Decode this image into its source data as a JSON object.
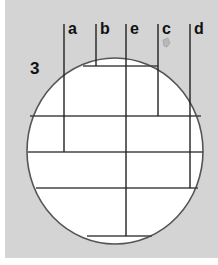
{
  "figure": {
    "figure_number": "3",
    "background_color": "#d4d4d4",
    "circle": {
      "cx": 115,
      "cy": 151,
      "rx": 88,
      "ry": 93,
      "fill": "#ffffff",
      "stroke": "#555555"
    },
    "chords": [
      {
        "name": "top-chord",
        "y": 66,
        "x1": 83,
        "x2": 158
      },
      {
        "name": "chord-1",
        "y": 116,
        "x1": 30,
        "x2": 201
      },
      {
        "name": "chord-2",
        "y": 152,
        "x1": 28,
        "x2": 203
      },
      {
        "name": "chord-3",
        "y": 188,
        "x1": 36,
        "x2": 198
      },
      {
        "name": "bottom-chord",
        "y": 236,
        "x1": 87,
        "x2": 152
      }
    ],
    "verticals": [
      {
        "label": "a",
        "x": 64,
        "y1": 24,
        "y2": 152
      },
      {
        "label": "b",
        "x": 96,
        "y1": 24,
        "y2": 66
      },
      {
        "label": "e",
        "x": 126,
        "y1": 24,
        "y2": 236
      },
      {
        "label": "c",
        "x": 158,
        "y1": 24,
        "y2": 116
      },
      {
        "label": "d",
        "x": 190,
        "y1": 24,
        "y2": 188
      }
    ],
    "line_color": "#222222"
  }
}
